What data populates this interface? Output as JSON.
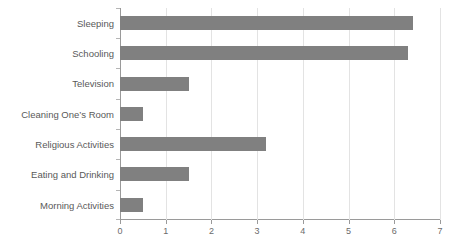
{
  "chart_data": {
    "type": "bar",
    "orientation": "horizontal",
    "title": "",
    "subtitle": "",
    "xlabel": "",
    "ylabel": "",
    "categories": [
      "Sleeping",
      "Schooling",
      "Television",
      "Cleaning One’s Room",
      "Religious Activities",
      "Eating and Drinking",
      "Morning Activities"
    ],
    "values": [
      6.4,
      6.3,
      1.5,
      0.5,
      3.2,
      1.5,
      0.5
    ],
    "xlim": [
      0,
      7
    ],
    "xticks": [
      0,
      1,
      2,
      3,
      4,
      5,
      6,
      7
    ],
    "xticklabels": [
      "0",
      "1",
      "2",
      "3",
      "4",
      "5",
      "6",
      "7"
    ],
    "grid": "vertical",
    "legend": "none",
    "bar_color": "#808080",
    "gridline_color": "#e3e3e3",
    "axis_color": "#9a9a9a",
    "label_color": "#595959"
  }
}
